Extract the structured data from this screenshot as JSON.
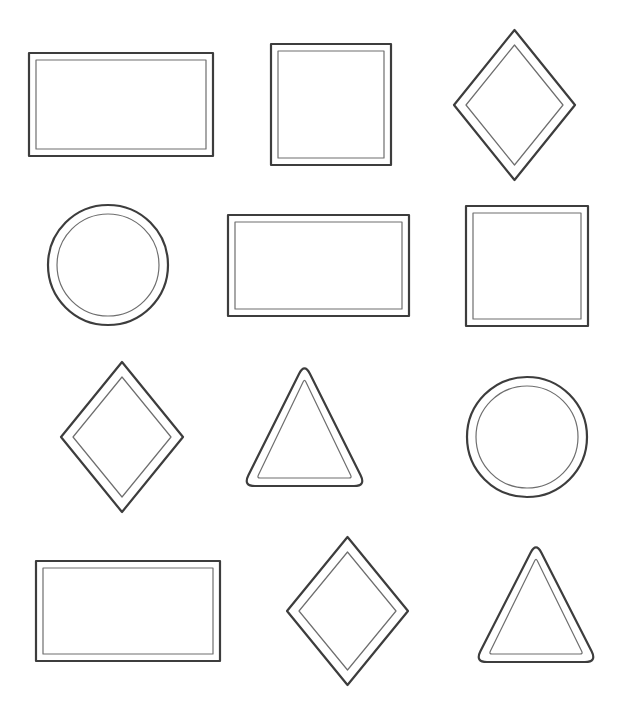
{
  "colors": {
    "background": "#ffffff",
    "outer_stroke": "#3d3d3d",
    "inner_stroke": "#6e6e6e"
  },
  "rows": [
    {
      "shapes": [
        {
          "type": "rectangle"
        },
        {
          "type": "square"
        },
        {
          "type": "diamond"
        }
      ]
    },
    {
      "shapes": [
        {
          "type": "circle"
        },
        {
          "type": "rectangle"
        },
        {
          "type": "square"
        }
      ]
    },
    {
      "shapes": [
        {
          "type": "diamond"
        },
        {
          "type": "triangle"
        },
        {
          "type": "circle"
        }
      ]
    },
    {
      "shapes": [
        {
          "type": "rectangle"
        },
        {
          "type": "diamond"
        },
        {
          "type": "triangle"
        }
      ]
    }
  ]
}
